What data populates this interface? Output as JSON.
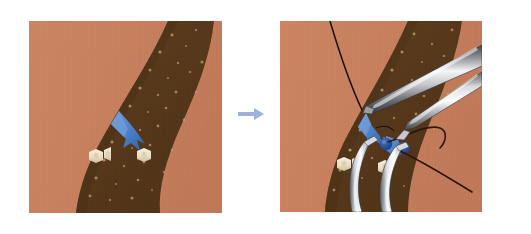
{
  "figure": {
    "domain": "Natural-Image",
    "kind": "medical-surgical-illustration",
    "title": "Two-panel surgical illustration: vessel before and during instrument manipulation",
    "background_color": "#ffffff",
    "canvas": {
      "width": 531,
      "height": 234
    }
  },
  "palette": {
    "page_background": "#ffffff",
    "tissue_light": "#c8815f",
    "tissue_light_shadow": "#b87352",
    "tissue_band_dark": "#5b3b1d",
    "tissue_band_dark_2": "#4d3118",
    "tissue_speckle": "#c9a478",
    "vessel_blue": "#4a7fc8",
    "vessel_blue_dark": "#2f5fa8",
    "vessel_blue_light": "#6f9bd8",
    "node_blue": "#2a4f9c",
    "clip_cream": "#efe3cc",
    "clip_cream_shadow": "#cbbb9d",
    "suture_black": "#181008",
    "instrument_light": "#f2f2f2",
    "instrument_mid": "#b9bcc0",
    "instrument_dark": "#55585c",
    "instrument_edge": "#2c2e31",
    "arrow_blue": "#9fb0dc",
    "arrow_blue_dark": "#8296cc"
  },
  "panels": [
    {
      "id": "panel-before",
      "label": "Before",
      "caption": "",
      "frame": {
        "x": 29,
        "y": 21,
        "width": 193,
        "height": 192
      },
      "contents": {
        "tissue_band": "dark curved band running from upper right to lower left",
        "vessel": "blue branching vessel near center",
        "clips": 3,
        "instruments": 0,
        "sutures": 0
      }
    },
    {
      "id": "panel-after",
      "label": "After",
      "caption": "",
      "frame": {
        "x": 280,
        "y": 21,
        "width": 202,
        "height": 191
      },
      "contents": {
        "tissue_band": "dark curved band running from upper right to lower left",
        "vessel": "blue branching vessel with two ligature nodes",
        "clips": 3,
        "instruments": 4,
        "sutures": 3
      }
    }
  ],
  "arrow": {
    "name": "progression-arrow",
    "direction": "right",
    "x": 238,
    "y": 108,
    "width": 26,
    "height": 14,
    "color": "#9fb0dc"
  },
  "annotations": {
    "vessel_label": "",
    "instrument_label": "",
    "suture_label": "",
    "step_numbers": []
  },
  "elements": {
    "instrument_upper_large": "curved metallic clamp entering from upper right",
    "instrument_upper_small": "fine metallic forceps entering from far right",
    "instrument_lower_left": "curved metallic forceps entering from bottom",
    "instrument_lower_right": "curved metallic forceps entering from bottom center",
    "suture_upper": "black suture thread descending from top edge",
    "suture_mid": "black suture loop curving to the right",
    "suture_lower": "black suture thread running to lower right",
    "node_left": "dark blue ligature node on vessel",
    "node_right": "dark blue ligature node on vessel"
  }
}
